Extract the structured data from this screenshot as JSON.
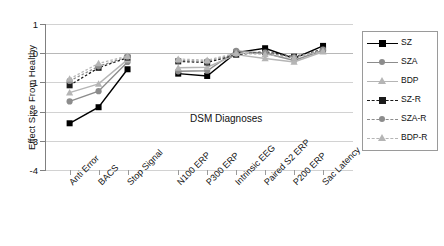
{
  "chart_data": {
    "type": "line",
    "title": "",
    "annotation": "DSM Diagnoses",
    "xlabel": "",
    "ylabel": "Effect Size From Healthy",
    "ylim": [
      -4,
      1
    ],
    "yticks": [
      "1",
      "0",
      "-1",
      "-2",
      "-3",
      "-4"
    ],
    "ytick_values": [
      1,
      0,
      -1,
      -2,
      -3,
      -4
    ],
    "grid": true,
    "legend_position": "right",
    "categories": [
      "Anti Error",
      "BACS",
      "Stop Signal",
      "N100 ERP",
      "P300 ERP",
      "Intrinsic EEG",
      "Paired S2 ERP",
      "P200 ERP",
      "Sac Latency"
    ],
    "group_breaks": [
      3
    ],
    "series": [
      {
        "name": "SZ",
        "color": "#000000",
        "marker": "square",
        "dash": "solid",
        "values": [
          -2.4,
          -1.85,
          -0.55,
          -0.7,
          -0.78,
          0.02,
          0.17,
          -0.18,
          0.25
        ]
      },
      {
        "name": "SZA",
        "color": "#8c8c8c",
        "marker": "circle",
        "dash": "solid",
        "values": [
          -1.65,
          -1.3,
          -0.3,
          -0.62,
          -0.6,
          0.08,
          0.0,
          -0.25,
          0.1
        ]
      },
      {
        "name": "BDP",
        "color": "#b5b5b5",
        "marker": "triangle",
        "dash": "solid",
        "values": [
          -1.35,
          -1.05,
          -0.22,
          -0.5,
          -0.48,
          -0.05,
          -0.18,
          -0.3,
          0.05
        ]
      },
      {
        "name": "SZ-R",
        "color": "#1a1a1a",
        "marker": "square",
        "dash": "dashed",
        "values": [
          -1.1,
          -0.5,
          -0.15,
          -0.28,
          -0.32,
          -0.05,
          0.05,
          -0.12,
          0.13
        ]
      },
      {
        "name": "SZA-R",
        "color": "#8c8c8c",
        "marker": "circle",
        "dash": "dashed",
        "values": [
          -0.95,
          -0.45,
          -0.12,
          -0.25,
          -0.28,
          -0.02,
          0.02,
          -0.14,
          0.12
        ]
      },
      {
        "name": "BDP-R",
        "color": "#b5b5b5",
        "marker": "triangle",
        "dash": "dashed",
        "values": [
          -0.88,
          -0.35,
          -0.1,
          -0.2,
          -0.24,
          0.0,
          -0.04,
          -0.16,
          0.08
        ]
      }
    ]
  }
}
